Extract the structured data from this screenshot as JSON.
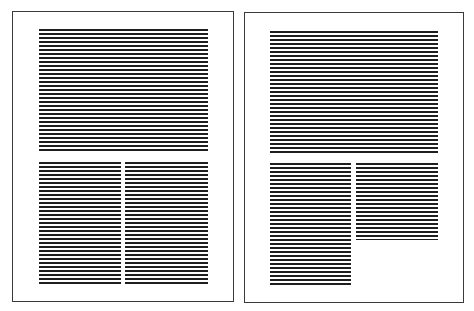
{
  "figure": {
    "line_color": "#1e1e1e",
    "border_color": "#3a3a3a",
    "line_pitch_px": 4
  },
  "pages": [
    {
      "name": "left-page",
      "box": {
        "x": 12,
        "y": 11,
        "w": 222,
        "h": 291
      },
      "blocks": [
        {
          "name": "full-width-text-block",
          "x": 39,
          "y": 29,
          "w": 169,
          "h": 123
        },
        {
          "name": "left-column-text-block",
          "x": 39,
          "y": 162,
          "w": 82,
          "h": 122
        },
        {
          "name": "right-column-text-block",
          "x": 125,
          "y": 162,
          "w": 83,
          "h": 122
        }
      ]
    },
    {
      "name": "right-page",
      "box": {
        "x": 244,
        "y": 12,
        "w": 220,
        "h": 291
      },
      "blocks": [
        {
          "name": "full-width-text-block",
          "x": 270,
          "y": 31,
          "w": 168,
          "h": 122
        },
        {
          "name": "left-column-text-block",
          "x": 270,
          "y": 163,
          "w": 81,
          "h": 123
        },
        {
          "name": "right-column-text-block",
          "x": 356,
          "y": 163,
          "w": 82,
          "h": 77
        }
      ]
    }
  ]
}
